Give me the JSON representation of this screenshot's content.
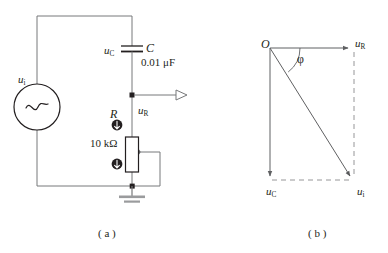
{
  "figure": {
    "title_a": "( a )",
    "title_b": "( b )"
  },
  "circuit": {
    "source": {
      "label": "u",
      "label_sub": "i",
      "symbol": "sine-wave"
    },
    "capacitor": {
      "voltage_label": "u",
      "voltage_label_sub": "C",
      "designator": "C",
      "value": "0.01 μF"
    },
    "resistor": {
      "designator": "R",
      "value": "10 kΩ",
      "voltage_label": "u",
      "voltage_label_sub": "R",
      "type": "potentiometer",
      "adjust_markers": 2
    },
    "ground": {
      "symbol": "earth-ground"
    },
    "output": {
      "symbol": "open-arrow-output"
    }
  },
  "phasor": {
    "origin_label": "O",
    "angle_label": "φ",
    "vectors": [
      {
        "name": "u",
        "sub": "R",
        "direction": "right"
      },
      {
        "name": "u",
        "sub": "C",
        "direction": "down"
      },
      {
        "name": "u",
        "sub": "i",
        "direction": "down-right"
      }
    ]
  },
  "colors": {
    "stroke": "#231f20",
    "wire": "#6f7072",
    "background": "#ffffff"
  }
}
